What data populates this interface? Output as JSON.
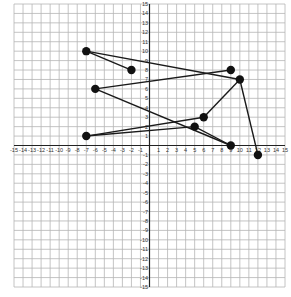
{
  "chart_data": {
    "type": "scatter",
    "title": "",
    "xlabel": "",
    "ylabel": "",
    "xlim": [
      -15,
      15
    ],
    "ylim": [
      -15,
      15
    ],
    "grid": true,
    "x_ticks": [
      -15,
      -14,
      -13,
      -12,
      -11,
      -10,
      -9,
      -8,
      -7,
      -6,
      -5,
      -4,
      -3,
      -2,
      -1,
      1,
      2,
      3,
      4,
      5,
      6,
      7,
      8,
      9,
      10,
      11,
      12,
      13,
      14,
      15
    ],
    "y_ticks": [
      15,
      14,
      13,
      12,
      11,
      10,
      9,
      8,
      7,
      6,
      5,
      4,
      3,
      2,
      1,
      -1,
      -2,
      -3,
      -4,
      -5,
      -6,
      -7,
      -8,
      -9,
      -10,
      -11,
      -12,
      -13,
      -14,
      -15
    ],
    "points": [
      {
        "id": "A",
        "x": -7,
        "y": 10
      },
      {
        "id": "B",
        "x": -2,
        "y": 8
      },
      {
        "id": "C",
        "x": 9,
        "y": 8
      },
      {
        "id": "D",
        "x": 10,
        "y": 7
      },
      {
        "id": "E",
        "x": -6,
        "y": 6
      },
      {
        "id": "F",
        "x": 6,
        "y": 3
      },
      {
        "id": "G",
        "x": 5,
        "y": 2
      },
      {
        "id": "H",
        "x": -7,
        "y": 1
      },
      {
        "id": "I",
        "x": 9,
        "y": 0
      },
      {
        "id": "J",
        "x": 12,
        "y": -1
      }
    ],
    "segments": [
      [
        "A",
        "B"
      ],
      [
        "A",
        "D"
      ],
      [
        "E",
        "C"
      ],
      [
        "E",
        "I"
      ],
      [
        "D",
        "J"
      ],
      [
        "D",
        "F"
      ],
      [
        "H",
        "F"
      ],
      [
        "H",
        "G"
      ],
      [
        "G",
        "I"
      ]
    ],
    "colors": {
      "grid": "#b5b5b5",
      "axis": "#222222",
      "line": "#1a1a1a",
      "point": "#111111"
    }
  }
}
